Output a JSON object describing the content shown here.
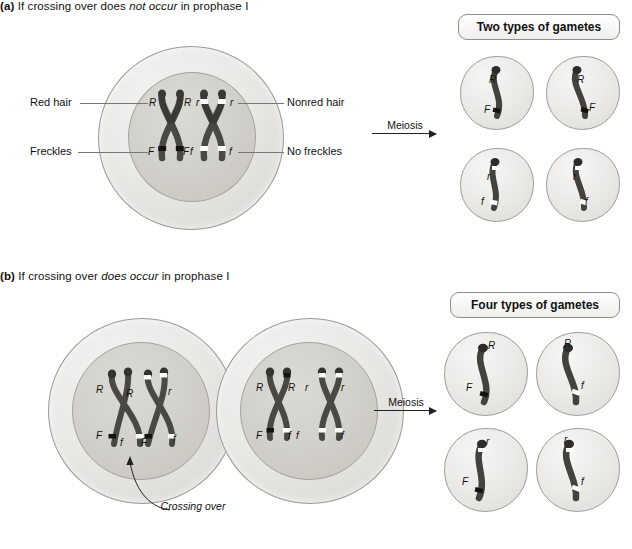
{
  "figure": {
    "panel_a": {
      "heading_label": "(a)",
      "heading_pre": "If crossing over does ",
      "heading_em": "not occur",
      "heading_post": " in prophase I",
      "left_labels": [
        {
          "text": "Red hair"
        },
        {
          "text": "Freckles"
        }
      ],
      "right_labels": [
        {
          "text": "Nonred hair"
        },
        {
          "text": "No freckles"
        }
      ],
      "cell_alleles": [
        {
          "text": "R"
        },
        {
          "text": "R"
        },
        {
          "text": "r"
        },
        {
          "text": "r"
        },
        {
          "text": "F"
        },
        {
          "text": "F"
        },
        {
          "text": "f"
        },
        {
          "text": "f"
        }
      ],
      "meiosis_label": "Meiosis",
      "gamete_box_title": "Two types of gametes",
      "gametes": [
        {
          "top_allele": "R",
          "bottom_allele": "F"
        },
        {
          "top_allele": "R",
          "bottom_allele": "F"
        },
        {
          "top_allele": "r",
          "bottom_allele": "f"
        },
        {
          "top_allele": "r",
          "bottom_allele": "f"
        }
      ]
    },
    "panel_b": {
      "heading_label": "(b)",
      "heading_pre": "If crossing over ",
      "heading_em": "does occur",
      "heading_post": " in prophase I",
      "left_cell_alleles": [
        {
          "text": "R"
        },
        {
          "text": "R"
        },
        {
          "text": "r"
        },
        {
          "text": "F"
        },
        {
          "text": "f"
        },
        {
          "text": "F"
        },
        {
          "text": "f"
        }
      ],
      "right_cell_alleles": [
        {
          "text": "R"
        },
        {
          "text": "R"
        },
        {
          "text": "r"
        },
        {
          "text": "r"
        },
        {
          "text": "F"
        },
        {
          "text": "f"
        },
        {
          "text": "f"
        },
        {
          "text": "f"
        }
      ],
      "callout": "Crossing over",
      "meiosis_label": "Meiosis",
      "gamete_box_title": "Four types of gametes",
      "gametes": [
        {
          "top_allele": "R",
          "bottom_allele": "F"
        },
        {
          "top_allele": "R",
          "bottom_allele": "f"
        },
        {
          "top_allele": "r",
          "bottom_allele": "F"
        },
        {
          "top_allele": "r",
          "bottom_allele": "f"
        }
      ]
    }
  },
  "colors": {
    "chromatid_dark": "#4a4843",
    "chromatid_mid": "#6b6862",
    "band_dark": "#1c1b19",
    "band_light": "#ffffff",
    "cell_outline": "#9a9a96",
    "text": "#111111"
  }
}
